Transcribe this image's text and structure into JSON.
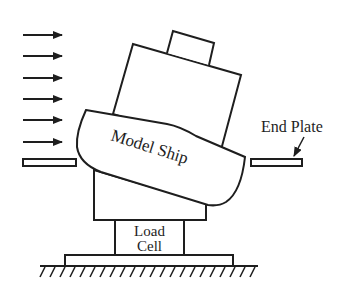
{
  "diagram": {
    "type": "schematic",
    "colors": {
      "line": "#1e1e1e",
      "background": "#ffffff"
    },
    "labels": {
      "model_ship": "Model Ship",
      "end_plate": "End Plate",
      "load_cell_line1": "Load",
      "load_cell_line2": "Cell"
    },
    "flow_arrows": {
      "count": 6,
      "direction": "right",
      "icon": "arrow-right-icon"
    },
    "components": [
      {
        "id": "flow-arrows",
        "label": "Incoming flow (6 arrows)"
      },
      {
        "id": "end-plate-left",
        "label": "End plate (left)"
      },
      {
        "id": "end-plate-right",
        "label": "End plate (right)",
        "callout": "End Plate"
      },
      {
        "id": "superstructure-top",
        "label": "Top block"
      },
      {
        "id": "superstructure",
        "label": "Upper body"
      },
      {
        "id": "hull",
        "label": "Model Ship"
      },
      {
        "id": "lower-body",
        "label": "Lower body / mount"
      },
      {
        "id": "load-cell",
        "label": "Load Cell"
      },
      {
        "id": "base-plate",
        "label": "Base plate"
      },
      {
        "id": "ground",
        "label": "Ground (hatched)"
      }
    ]
  }
}
